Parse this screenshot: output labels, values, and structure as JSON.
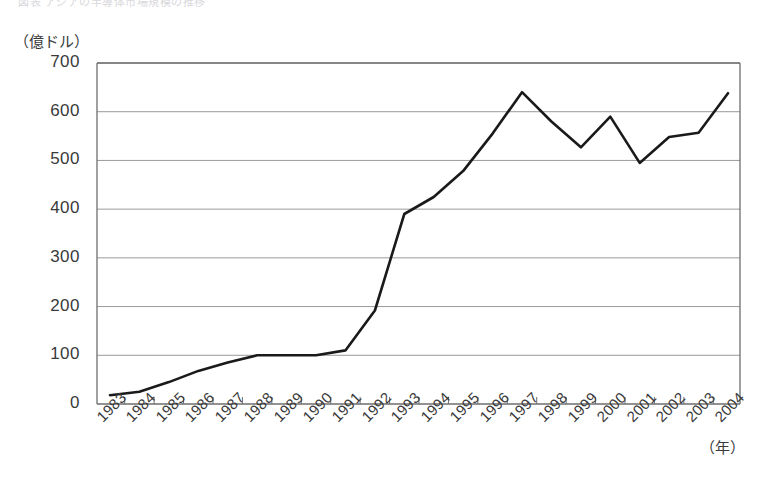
{
  "header": {
    "cut_off_caption": "図表  アジアの半導体市場規模の推移"
  },
  "axes": {
    "y_unit_label": "（億ドル）",
    "x_unit_label": "（年）",
    "y_ticks": [
      "0",
      "100",
      "200",
      "300",
      "400",
      "500",
      "600",
      "700"
    ],
    "x_ticks": [
      "1983",
      "1984",
      "1985",
      "1986",
      "1987",
      "1988",
      "1989",
      "1990",
      "1991",
      "1992",
      "1993",
      "1994",
      "1995",
      "1996",
      "1997",
      "1998",
      "1999",
      "2000",
      "2001",
      "2002",
      "2003",
      "2004"
    ]
  },
  "style": {
    "line_color": "#1a1a1a",
    "grid_color": "#9a9a9a",
    "frame_color": "#6e6e6e",
    "text_color": "#3a3a3a",
    "background": "#ffffff"
  },
  "chart_data": {
    "type": "line",
    "title": "",
    "xlabel": "（年）",
    "ylabel": "（億ドル）",
    "ylim": [
      0,
      700
    ],
    "ytick_step": 100,
    "grid": true,
    "legend": "none",
    "categories": [
      "1983",
      "1984",
      "1985",
      "1986",
      "1987",
      "1988",
      "1989",
      "1990",
      "1991",
      "1992",
      "1993",
      "1994",
      "1995",
      "1996",
      "1997",
      "1998",
      "1999",
      "2000",
      "2001",
      "2002",
      "2003",
      "2004"
    ],
    "values": [
      18,
      25,
      45,
      68,
      85,
      100,
      100,
      100,
      110,
      192,
      390,
      425,
      478,
      555,
      640,
      580,
      527,
      590,
      495,
      548,
      557,
      638
    ],
    "series": [
      {
        "name": "市場規模",
        "values": [
          18,
          25,
          45,
          68,
          85,
          100,
          100,
          100,
          110,
          192,
          390,
          425,
          478,
          555,
          640,
          580,
          527,
          590,
          495,
          548,
          557,
          638
        ]
      }
    ]
  }
}
